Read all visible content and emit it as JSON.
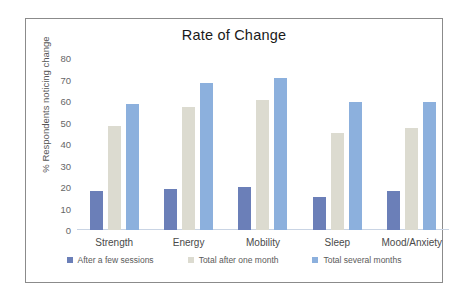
{
  "chart_data": {
    "type": "bar",
    "title": "Rate of Change",
    "xlabel": "",
    "ylabel": "% Respondents noticing change",
    "ylim": [
      0,
      80
    ],
    "yticks": [
      80,
      70,
      60,
      50,
      40,
      30,
      20,
      10,
      0
    ],
    "grid": false,
    "legend_position": "bottom",
    "categories": [
      "Strength",
      "Energy",
      "Mobility",
      "Sleep",
      "Mood/Anxiety"
    ],
    "series": [
      {
        "name": "After a few sessions",
        "color": "#6b7fb8",
        "values": [
          18,
          19,
          20,
          15.5,
          18
        ]
      },
      {
        "name": "Total after one month",
        "color": "#dcdbd0",
        "values": [
          48.5,
          57,
          60.5,
          45,
          47.5
        ]
      },
      {
        "name": "Total several months",
        "color": "#8cb0dd",
        "values": [
          58.5,
          68.5,
          70.5,
          59.5,
          59.5
        ]
      }
    ]
  }
}
